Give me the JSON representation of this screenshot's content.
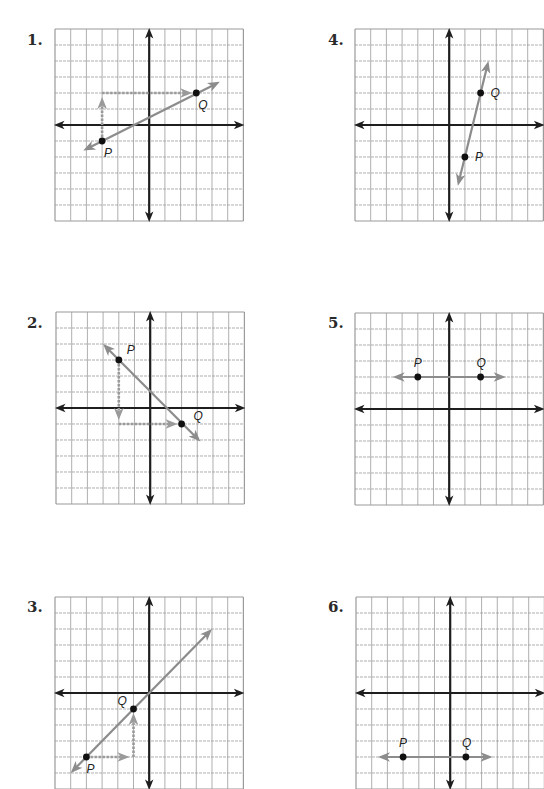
{
  "grid": {
    "cells": 12,
    "origin_cell": [
      6,
      6
    ],
    "line_color": "#9a9a9a",
    "axis_color": "#1e1e1e",
    "line_color_vector": "#8c8c8c",
    "dash_color": "#9a9a9a",
    "point_color": "#111111"
  },
  "problems": [
    {
      "number": "1.",
      "left": 55,
      "top": 29,
      "numLeft": 27,
      "numTop": 31,
      "P": {
        "label": "P",
        "x": -3,
        "y": -1
      },
      "Q": {
        "label": "Q",
        "x": 3,
        "y": 2
      },
      "line": {
        "type": "line-through",
        "from": [
          -4.2,
          -1.6
        ],
        "to": [
          4.5,
          2.7
        ]
      },
      "dashed": [
        {
          "from": [
            -3,
            -1
          ],
          "to": [
            -3,
            2
          ],
          "arrow": "up"
        },
        {
          "from": [
            -3,
            2
          ],
          "to": [
            3,
            2
          ],
          "arrow": "right"
        }
      ],
      "labelOffsets": {
        "P": [
          2,
          16
        ],
        "Q": [
          2,
          16
        ]
      }
    },
    {
      "number": "4.",
      "left": 355,
      "top": 29,
      "numLeft": 328,
      "numTop": 31,
      "P": {
        "label": "P",
        "x": 1,
        "y": -2
      },
      "Q": {
        "label": "Q",
        "x": 2,
        "y": 2
      },
      "line": {
        "type": "line-through",
        "from": [
          0.55,
          -3.8
        ],
        "to": [
          2.5,
          4
        ]
      },
      "dashed": [],
      "labelOffsets": {
        "P": [
          10,
          4
        ],
        "Q": [
          10,
          4
        ]
      }
    },
    {
      "number": "2.",
      "left": 56,
      "top": 312,
      "numLeft": 27,
      "numTop": 314,
      "P": {
        "label": "P",
        "x": -2,
        "y": 3
      },
      "Q": {
        "label": "Q",
        "x": 2,
        "y": -1
      },
      "line": {
        "type": "line-through",
        "from": [
          -3,
          4
        ],
        "to": [
          3.2,
          -2.1
        ]
      },
      "dashed": [
        {
          "from": [
            -2,
            3
          ],
          "to": [
            -2,
            -1
          ],
          "arrow": "down"
        },
        {
          "from": [
            -2,
            -1
          ],
          "to": [
            2,
            -1
          ],
          "arrow": "right"
        }
      ],
      "labelOffsets": {
        "P": [
          8,
          -6
        ],
        "Q": [
          12,
          -4
        ]
      }
    },
    {
      "number": "5.",
      "left": 355,
      "top": 313,
      "numLeft": 328,
      "numTop": 314,
      "P": {
        "label": "P",
        "x": -2,
        "y": 2
      },
      "Q": {
        "label": "Q",
        "x": 2,
        "y": 2
      },
      "line": {
        "type": "line-through",
        "from": [
          -3.6,
          2
        ],
        "to": [
          3.6,
          2
        ]
      },
      "dashed": [],
      "labelOffsets": {
        "P": [
          -4,
          -10
        ],
        "Q": [
          -4,
          -10
        ]
      }
    },
    {
      "number": "3.",
      "left": 55,
      "top": 597,
      "numLeft": 27,
      "numTop": 598,
      "P": {
        "label": "P",
        "x": -4,
        "y": -4
      },
      "Q": {
        "label": "Q",
        "x": -1,
        "y": -1
      },
      "line": {
        "type": "line-through",
        "from": [
          -5,
          -5
        ],
        "to": [
          4,
          4
        ]
      },
      "dashed": [
        {
          "from": [
            -4,
            -4
          ],
          "to": [
            -1,
            -4
          ],
          "arrow": "right"
        },
        {
          "from": [
            -1,
            -4
          ],
          "to": [
            -1,
            -1
          ],
          "arrow": "up"
        }
      ],
      "labelOffsets": {
        "P": [
          0,
          16
        ],
        "Q": [
          -16,
          -4
        ]
      }
    },
    {
      "number": "6.",
      "left": 356,
      "top": 597,
      "numLeft": 328,
      "numTop": 598,
      "P": {
        "label": "P",
        "x": -3,
        "y": -4
      },
      "Q": {
        "label": "Q",
        "x": 1,
        "y": -4
      },
      "line": {
        "type": "line-through",
        "from": [
          -4.6,
          -4
        ],
        "to": [
          2.7,
          -4
        ]
      },
      "dashed": [],
      "labelOffsets": {
        "P": [
          -4,
          -10
        ],
        "Q": [
          -4,
          -10
        ]
      }
    }
  ],
  "chart_data": {
    "type": "scatter",
    "grid_range": {
      "x": [
        -6,
        6
      ],
      "y": [
        -6,
        6
      ]
    },
    "grid": true,
    "panels": [
      {
        "panel": "1",
        "P": [
          -3,
          -1
        ],
        "Q": [
          3,
          2
        ],
        "rise": 3,
        "run": 6,
        "slope": 0.5,
        "slope_triangle": true
      },
      {
        "panel": "2",
        "P": [
          -2,
          3
        ],
        "Q": [
          2,
          -1
        ],
        "rise": -4,
        "run": 4,
        "slope": -1,
        "slope_triangle": true
      },
      {
        "panel": "3",
        "P": [
          -4,
          -4
        ],
        "Q": [
          -1,
          -1
        ],
        "rise": 3,
        "run": 3,
        "slope": 1,
        "slope_triangle": true
      },
      {
        "panel": "4",
        "P": [
          1,
          -2
        ],
        "Q": [
          2,
          2
        ],
        "rise": 4,
        "run": 1,
        "slope": 4,
        "slope_triangle": false
      },
      {
        "panel": "5",
        "P": [
          -2,
          2
        ],
        "Q": [
          2,
          2
        ],
        "rise": 0,
        "run": 4,
        "slope": 0,
        "slope_triangle": false
      },
      {
        "panel": "6",
        "P": [
          -3,
          -4
        ],
        "Q": [
          1,
          -4
        ],
        "rise": 0,
        "run": 4,
        "slope": 0,
        "slope_triangle": false
      }
    ]
  }
}
